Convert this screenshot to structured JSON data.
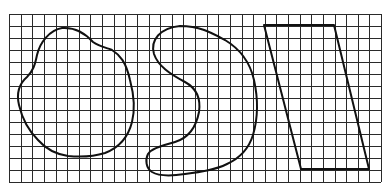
{
  "figure": {
    "width": 387,
    "height": 193,
    "background": "#ffffff",
    "grid": {
      "left": 9,
      "top": 14,
      "columns": 32,
      "rows": 14,
      "cell_width": 11.625,
      "cell_height": 12,
      "line_color": "#2a2a2a"
    },
    "shapes": [
      {
        "name": "irregular-blob",
        "type": "closed-curve",
        "stroke": "#111111",
        "path": "M62,28 C75,27 85,33 93,42 C100,47 108,48 112,50 C120,55 126,62 130,80 C134,95 135,110 132,122 C128,138 118,148 105,153 C92,157 78,157 68,156 C55,154 45,148 38,140 C28,130 22,118 19,105 C16,92 20,83 27,77 C33,71 35,65 37,55 C40,42 50,30 62,28 Z"
      },
      {
        "name": "bean-curve",
        "type": "closed-curve",
        "stroke": "#111111",
        "path": "M180,26 C200,26 212,33 225,40 C240,49 250,62 254,80 C258,98 258,118 253,135 C249,148 240,158 227,164 C215,170 200,172 185,174 C172,176 160,177 152,172 C146,168 145,160 148,154 C152,148 162,146 175,142 C188,138 196,128 199,112 C201,98 196,88 185,82 C170,74 158,66 154,54 C150,40 160,28 180,26 Z"
      },
      {
        "name": "parallelogram",
        "type": "polygon",
        "stroke": "#111111",
        "points": "264,25 334,25 369,169 301,169"
      }
    ]
  }
}
